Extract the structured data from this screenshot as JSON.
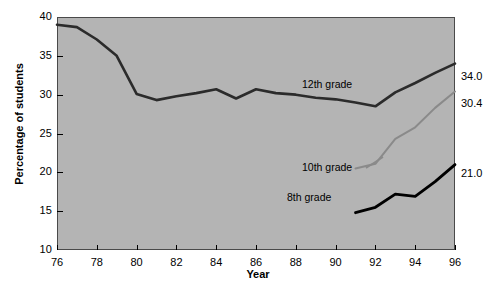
{
  "chart_data": {
    "type": "line",
    "title": "",
    "xlabel": "Year",
    "ylabel": "Percentage of students",
    "xlim": [
      76,
      96
    ],
    "ylim": [
      10,
      40
    ],
    "xticks": [
      "76",
      "78",
      "80",
      "82",
      "84",
      "86",
      "88",
      "90",
      "92",
      "94",
      "96"
    ],
    "yticks": [
      "10",
      "15",
      "20",
      "25",
      "30",
      "35",
      "40"
    ],
    "grid": false,
    "legend_position": "inline-annotations",
    "plot_background": "#b4b4b4",
    "series": [
      {
        "name": "12th grade",
        "color": "#2b2b2b",
        "x": [
          76,
          77,
          78,
          79,
          80,
          81,
          82,
          83,
          84,
          85,
          86,
          87,
          88,
          89,
          90,
          91,
          92,
          93,
          94,
          95,
          96
        ],
        "values": [
          39.0,
          38.7,
          37.1,
          35.0,
          30.1,
          29.3,
          29.8,
          30.2,
          30.7,
          29.5,
          30.7,
          30.2,
          30.0,
          29.6,
          29.4,
          29.0,
          28.5,
          30.3,
          31.5,
          32.8,
          34.0
        ],
        "end_label": "34.0",
        "annotation": "12th grade"
      },
      {
        "name": "10th grade",
        "color": "#8a8a8a",
        "x": [
          91,
          92,
          93,
          94,
          95,
          96
        ],
        "values": [
          20.5,
          21.1,
          24.3,
          25.8,
          28.3,
          30.4
        ],
        "end_label": "30.4",
        "annotation": "10th grade"
      },
      {
        "name": "8th grade",
        "color": "#000000",
        "x": [
          91,
          92,
          93,
          94,
          95,
          96
        ],
        "values": [
          14.8,
          15.5,
          17.2,
          16.9,
          18.8,
          21.0
        ],
        "end_label": "21.0",
        "annotation": "8th grade"
      }
    ]
  },
  "annotations": {
    "label_12th": "12th grade",
    "label_10th": "10th grade",
    "label_8th": "8th grade",
    "end_12th": "34.0",
    "end_10th": "30.4",
    "end_8th": "21.0"
  }
}
